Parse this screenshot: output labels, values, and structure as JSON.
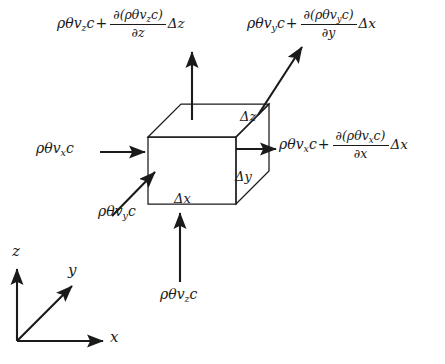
{
  "figure": {
    "background_color": "#ffffff",
    "line_color": "#1a1a1a"
  },
  "fluxes": {
    "top_z": {
      "name": "top-face-z-flux",
      "base": "ρθv",
      "base_sub": "z",
      "base_tail": "c",
      "operator": "+",
      "numerator": "∂(ρθv",
      "numerator_sub": "z",
      "numerator_tail": "c)",
      "denominator": "∂z",
      "delta": "Δz",
      "full_text": "ρθv_z c + ∂(ρθv_z c)/∂z Δz",
      "direction": "out-upward"
    },
    "top_y": {
      "name": "back-face-y-flux",
      "base": "ρθv",
      "base_sub": "y",
      "base_tail": "c",
      "operator": "+",
      "numerator": "∂(ρθv",
      "numerator_sub": "y",
      "numerator_tail": "c)",
      "denominator": "∂y",
      "delta": "Δx",
      "full_text": "ρθv_y c + ∂(ρθv_y c)/∂y Δx",
      "direction": "out-diagonal-upright"
    },
    "right_x": {
      "name": "right-face-x-flux",
      "base": "ρθv",
      "base_sub": "x",
      "base_tail": "c",
      "operator": "+",
      "numerator": "∂(ρθv",
      "numerator_sub": "x",
      "numerator_tail": "c)",
      "denominator": "∂x",
      "delta": "Δx",
      "full_text": "ρθv_x c + ∂(ρθv_x c)/∂x Δx",
      "direction": "out-right"
    },
    "left_x": {
      "name": "left-face-x-flux",
      "base": "ρθv",
      "base_sub": "x",
      "base_tail": "c",
      "full_text": "ρθv_x c",
      "direction": "in-right"
    },
    "diag_y": {
      "name": "front-face-y-flux",
      "base": "ρθv",
      "base_sub": "y",
      "base_tail": "c",
      "full_text": "ρθv_y c",
      "direction": "in-diagonal-upright"
    },
    "bottom_z": {
      "name": "bottom-face-z-flux",
      "base": "ρθv",
      "base_sub": "z",
      "base_tail": "c",
      "full_text": "ρθv_z c",
      "direction": "in-upward"
    }
  },
  "edges": {
    "dz": "Δz",
    "dy": "Δy",
    "dx": "Δx"
  },
  "axes": {
    "z": "z",
    "y": "y",
    "x": "x"
  }
}
